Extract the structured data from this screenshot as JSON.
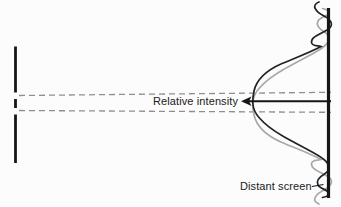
{
  "figure": {
    "labels": {
      "relative_intensity": "Relative intensity",
      "distant_screen": "Distant screen"
    },
    "colors": {
      "ink": "#161616",
      "dark_curve": "#232323",
      "gray_curve": "#a9a9a9",
      "dashed_line": "#8f8f8f",
      "background": "#fcfcfc"
    },
    "curves": {
      "dark_path": "M 319,2 C 311,5 315,11.5 324,16 C 332.5,20.5 334,26 327,30 C 317,35.5 311,37.5 311.5,42.5 C 312,46.5 317.5,45.5 321,46.5 C 310,52.5 295,58 282,63.5 C 266,70.5 256.5,80 254,91 C 253,95.5 252.6,99.5 252.8,103.5 C 253.2,109 255.5,113.5 259,117.5 C 264.5,124 273,130.5 283.5,136.5 C 295,143 307,149 316.5,154.5 C 322.5,158 326.5,161 328,164 C 330,167.5 329.5,171 324.5,174 C 318.5,177.5 316,181 318,185 C 320,188.5 326,189.5 328.5,192 C 330.5,194.5 327.5,196.5 322.5,197.5"
    },
    "arrowhead_points": "241,101.3 251.5,96.6 249,101.3 251.5,106"
  }
}
